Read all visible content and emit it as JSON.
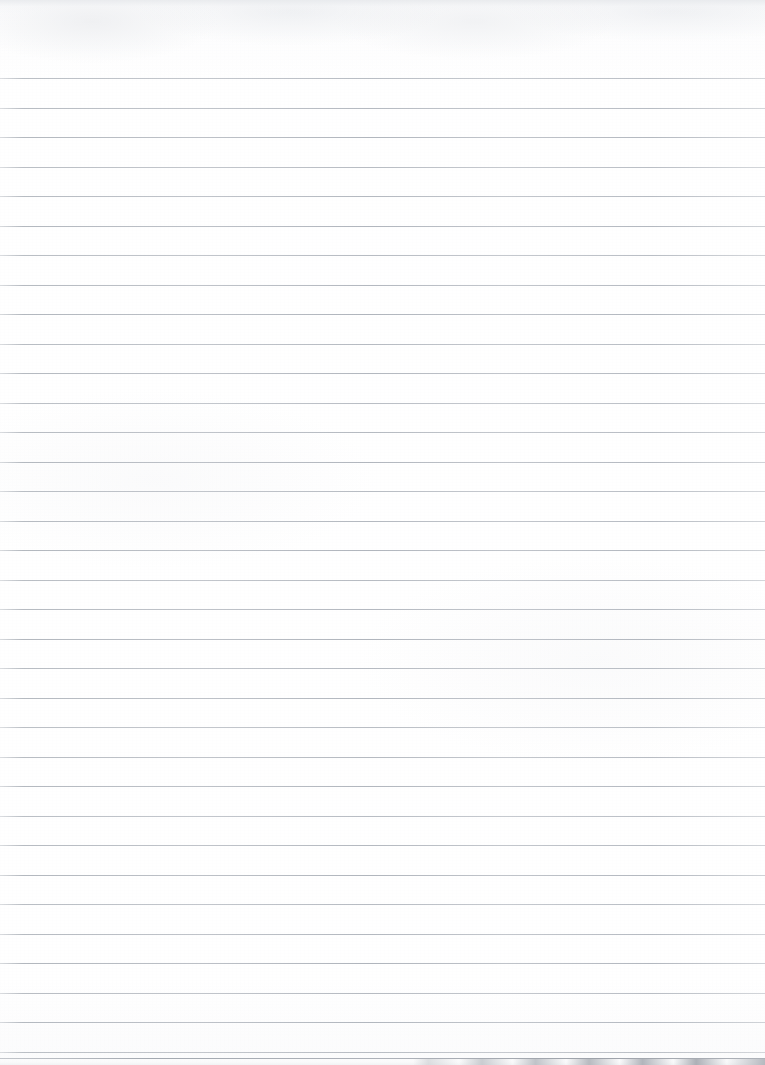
{
  "document": {
    "type": "scanned-lined-notebook-page",
    "title": "Blank lined paper scan",
    "orientation": "portrait",
    "page_width_px": 765,
    "page_height_px": 1065,
    "paper_color": "#fdfdfd",
    "has_text": false,
    "has_handwriting": false,
    "has_images": false,
    "content_text": ""
  },
  "ruling": {
    "style": "wide-ruled-horizontal",
    "line_color": "#a3a9b1",
    "line_thickness_px": 1,
    "line_spacing_px": 29.5,
    "first_line_y_px": 78,
    "line_count": 34,
    "left_inset_px": 0,
    "right_inset_px": 0,
    "full_bleed": true,
    "margin_rule": "none",
    "top_margin_px": 78,
    "line_positions_y": [
      78,
      107.5,
      137,
      166.5,
      196,
      225.5,
      255,
      284.5,
      314,
      343.5,
      373,
      402.5,
      432,
      461.5,
      491,
      520.5,
      550,
      579.5,
      609,
      638.5,
      668,
      697.5,
      727,
      756.5,
      786,
      815.5,
      845,
      874.5,
      904,
      933.5,
      963,
      992.5,
      1022,
      1051.5
    ]
  },
  "artifacts": {
    "top_fringe": {
      "present": true,
      "description": "faint mottled gray scanner fringe along top edge",
      "height_px": 14,
      "color": "#e7e9ec"
    },
    "bottom_scan_edge": {
      "present": true,
      "description": "thin gray scanner edge band with alternating light and dark segments toward the right side",
      "height_px": 7,
      "start_x_px": 420,
      "color": "#acb0b6"
    },
    "paper_texture": {
      "present": true,
      "description": "very subtle off-white mottling from the scan",
      "color": "#fafafb"
    }
  }
}
